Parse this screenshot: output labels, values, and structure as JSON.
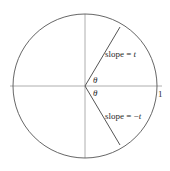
{
  "diagram": {
    "type": "unit-circle",
    "circle": {
      "cx": 85,
      "cy": 86,
      "r": 72
    },
    "axes": {
      "horizontal": {
        "x1": 10,
        "x2": 162,
        "y": 86
      },
      "vertical": {
        "x": 85,
        "y1": 14,
        "y2": 158
      }
    },
    "rays": [
      {
        "name": "upper-ray",
        "x2": 120,
        "y2": 27
      },
      {
        "name": "lower-ray",
        "x2": 120,
        "y2": 145
      }
    ],
    "colors": {
      "stroke": "#555555",
      "axis": "#9a9a9a",
      "text": "#2a2a2a"
    },
    "labels": {
      "slope_upper_prefix": "slope = ",
      "slope_upper_var": "t",
      "slope_lower_prefix": "slope = −",
      "slope_lower_var": "t",
      "theta_upper": "θ",
      "theta_lower": "θ",
      "unit": "1"
    }
  }
}
